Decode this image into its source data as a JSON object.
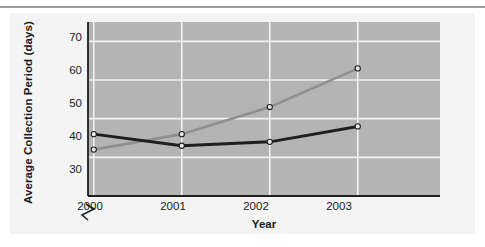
{
  "chart_data": {
    "type": "line",
    "title": "",
    "xlabel": "Year",
    "ylabel": "Average Collection Period (days)",
    "categories": [
      "2000",
      "2001",
      "2002",
      "2003"
    ],
    "x": [
      2000,
      2001,
      2002,
      2003
    ],
    "ylim": [
      30,
      75
    ],
    "ytick_labels": [
      "30",
      "40",
      "50",
      "60",
      "70"
    ],
    "yticks": [
      30,
      40,
      50,
      60,
      70
    ],
    "grid": "both-white-gridlines",
    "axis_break": "y-axis broken below 30",
    "legend_position": "inline-end-of-line-labels",
    "plot_background": "#b4b4b4",
    "gridline_color": "#f2f2f2",
    "series": [
      {
        "name": "Compton",
        "values": [
          42,
          46,
          53,
          63
        ],
        "color": "#8f8f8f",
        "marker": "open-circle",
        "line_width": 2.6
      },
      {
        "name": "Industry",
        "values": [
          46,
          43,
          44,
          48
        ],
        "color": "#1f1f1f",
        "marker": "open-circle",
        "line_width": 3.0
      }
    ]
  },
  "labels": {
    "ylabel": "Average Collection Period (days)",
    "xlabel": "Year",
    "yticks": [
      "30",
      "40",
      "50",
      "60",
      "70"
    ],
    "xticks": [
      "2000",
      "2001",
      "2002",
      "2003"
    ],
    "series_compton": "Compton",
    "series_industry": "Industry"
  }
}
